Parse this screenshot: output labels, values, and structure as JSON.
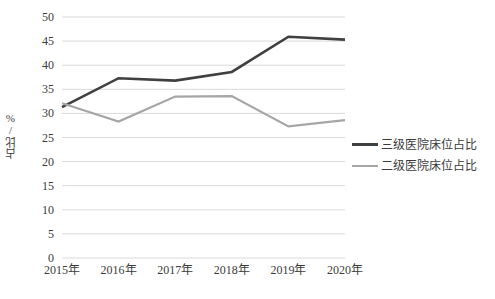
{
  "chart_data": {
    "type": "line",
    "title": "",
    "xlabel": "",
    "ylabel": "占比/%",
    "categories": [
      "2015年",
      "2016年",
      "2017年",
      "2018年",
      "2019年",
      "2020年"
    ],
    "series": [
      {
        "name": "三级医院床位占比",
        "color": "#404040",
        "values": [
          31.3,
          37.3,
          36.8,
          38.6,
          45.9,
          45.3
        ]
      },
      {
        "name": "二级医院床位占比",
        "color": "#a6a6a6",
        "values": [
          32.1,
          28.3,
          33.5,
          33.6,
          27.3,
          28.6
        ]
      }
    ],
    "ylim": [
      0,
      50
    ],
    "ytick_step": 5,
    "yticks": [
      "0",
      "5",
      "10",
      "15",
      "20",
      "25",
      "30",
      "35",
      "40",
      "45",
      "50"
    ],
    "grid": "horizontal",
    "legend_position": "right"
  },
  "legend": {
    "items": [
      {
        "label": "三级医院床位占比"
      },
      {
        "label": "二级医院床位占比"
      }
    ]
  }
}
